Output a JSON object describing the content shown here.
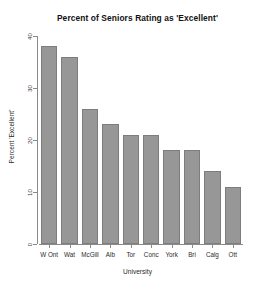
{
  "chart_data": {
    "type": "bar",
    "title": "Percent of Seniors Rating as 'Excellent'",
    "xlabel": "University",
    "ylabel": "Percent 'Excellent'",
    "categories": [
      "W Ont",
      "Wat",
      "McGill",
      "Alb",
      "Tor",
      "Conc",
      "York",
      "Bri",
      "Calg",
      "Ott"
    ],
    "values": [
      38,
      36,
      26,
      23,
      21,
      21,
      18,
      18,
      14,
      11
    ],
    "ylim": [
      0,
      40
    ],
    "yticks": [
      0,
      10,
      20,
      30,
      40
    ],
    "ytick_labels": [
      "0",
      "10",
      "20",
      "30",
      "40"
    ],
    "grid": false,
    "legend": false,
    "bar_color": "#979797",
    "bar_border_color": "#7d7d7d",
    "axis_color": "#8a8a8a",
    "background": "#ffffff"
  }
}
